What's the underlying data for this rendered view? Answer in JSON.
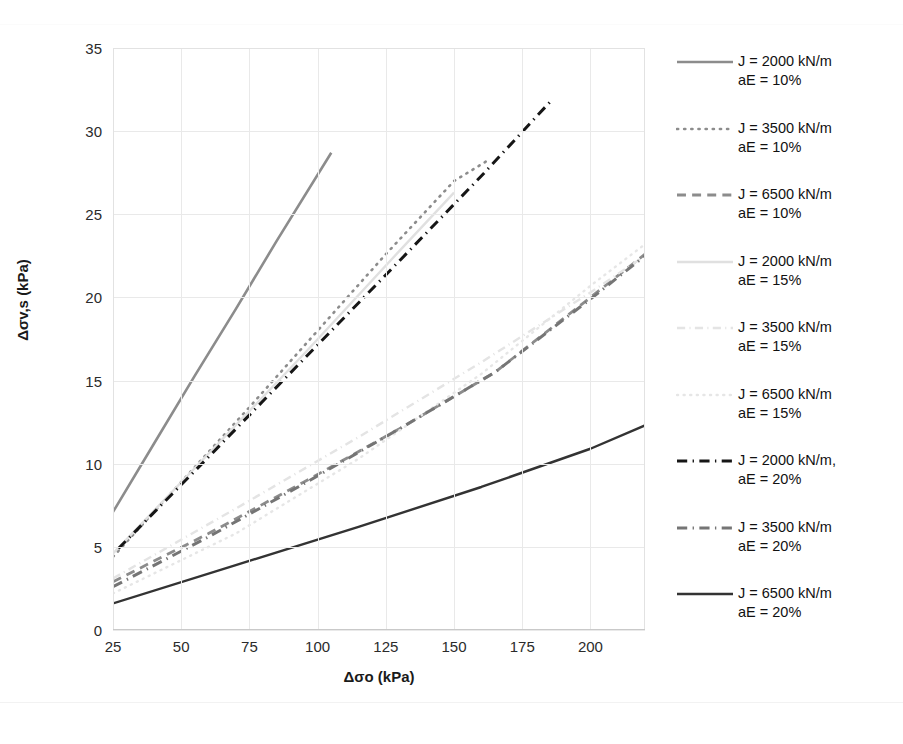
{
  "chart_data": {
    "type": "line",
    "title": "",
    "xlabel": "Δσo (kPa)",
    "ylabel": "Δσv,s (kPa)",
    "xlim": [
      25,
      220
    ],
    "ylim": [
      0,
      35
    ],
    "xticks": [
      25,
      50,
      75,
      100,
      125,
      150,
      175,
      200
    ],
    "yticks": [
      0,
      5,
      10,
      15,
      20,
      25,
      30,
      35
    ],
    "grid": true,
    "legend_position": "right",
    "series": [
      {
        "name": "J = 2000 kN/m\naE = 10%",
        "label_line1": "J = 2000 kN/m",
        "label_line2": "aE = 10%",
        "style": "solid",
        "color": "#8c8c8c",
        "width": 2.6,
        "x": [
          25,
          40,
          55,
          70,
          85,
          105
        ],
        "y": [
          7.1,
          11.2,
          15.3,
          19.3,
          23.4,
          28.7
        ]
      },
      {
        "name": "J = 3500 kN/m\naE = 10%",
        "label_line1": "J = 3500 kN/m",
        "label_line2": "aE = 10%",
        "style": "dotted",
        "color": "#8c8c8c",
        "width": 2.6,
        "x": [
          25,
          50,
          75,
          100,
          125,
          150,
          163
        ],
        "y": [
          4.4,
          8.9,
          13.4,
          18.0,
          22.6,
          27.0,
          28.3
        ]
      },
      {
        "name": "J = 6500 kN/m\naE = 10%",
        "label_line1": "J = 6500 kN/m",
        "label_line2": "aE = 10%",
        "style": "dashed",
        "color": "#8c8c8c",
        "width": 2.8,
        "x": [
          25,
          60,
          95,
          130,
          165,
          200,
          220
        ],
        "y": [
          2.9,
          5.8,
          8.9,
          12.1,
          15.5,
          20.0,
          22.6
        ]
      },
      {
        "name": "J = 2000 kN/m\naE = 15%",
        "label_line1": "J = 2000 kN/m",
        "label_line2": "aE = 15%",
        "style": "solid",
        "color": "#e0e0e0",
        "width": 2.4,
        "x": [
          25,
          60,
          95,
          130,
          150
        ],
        "y": [
          4.6,
          10.6,
          16.6,
          22.8,
          26.3
        ]
      },
      {
        "name": "J = 3500 kN/m\naE = 15%",
        "label_line1": "J = 3500 kN/m",
        "label_line2": "aE = 15%",
        "style": "dashdot",
        "color": "#e4e4e4",
        "width": 2.4,
        "x": [
          25,
          70,
          115,
          160,
          200,
          220
        ],
        "y": [
          3.1,
          7.3,
          11.6,
          16.1,
          20.3,
          22.5
        ]
      },
      {
        "name": "J = 6500 kN/m\naE = 15%",
        "label_line1": "J = 6500 kN/m",
        "label_line2": "aE = 15%",
        "style": "dotted",
        "color": "#e6e6e6",
        "width": 2.4,
        "x": [
          25,
          70,
          115,
          160,
          200,
          220
        ],
        "y": [
          2.2,
          5.8,
          10.3,
          15.4,
          20.7,
          23.2
        ]
      },
      {
        "name": "J = 2000 kN/m, aE = 20%",
        "label_line1": "J = 2000 kN/m,",
        "label_line2": "aE = 20%",
        "style": "dashdot",
        "color": "#161616",
        "width": 3.0,
        "x": [
          27,
          60,
          95,
          130,
          160,
          186
        ],
        "y": [
          4.9,
          10.4,
          16.3,
          22.2,
          27.3,
          31.9
        ]
      },
      {
        "name": "J = 3500 kN/m\naE = 20%",
        "label_line1": "J = 3500 kN/m",
        "label_line2": "aE = 20%",
        "style": "dashdot",
        "color": "#757575",
        "width": 3.0,
        "x": [
          25,
          60,
          95,
          130,
          165,
          200,
          220
        ],
        "y": [
          2.6,
          5.6,
          8.8,
          12.1,
          15.5,
          19.9,
          22.5
        ]
      },
      {
        "name": "J = 6500 kN/m\naE = 20%",
        "label_line1": "J = 6500 kN/m",
        "label_line2": "aE = 20%",
        "style": "solid",
        "color": "#333333",
        "width": 2.4,
        "x": [
          25,
          70,
          115,
          160,
          200,
          220
        ],
        "y": [
          1.6,
          3.9,
          6.2,
          8.6,
          10.9,
          12.3
        ]
      }
    ]
  },
  "axes": {
    "y_title": "Δσv,s (kPa)",
    "x_title": "Δσo (kPa)"
  },
  "legend": {
    "items": [
      {
        "label": "J = 2000 kN/m\naE = 10%"
      },
      {
        "label": "J = 3500 kN/m\naE = 10%"
      },
      {
        "label": "J = 6500 kN/m\naE = 10%"
      },
      {
        "label": "J = 2000 kN/m\naE = 15%"
      },
      {
        "label": "J = 3500 kN/m\naE = 15%"
      },
      {
        "label": "J = 6500 kN/m\naE = 15%"
      },
      {
        "label": "J = 2000 kN/m,\naE = 20%"
      },
      {
        "label": "J = 3500 kN/m\naE = 20%"
      },
      {
        "label": "J = 6500 kN/m\naE = 20%"
      }
    ]
  },
  "caption": {
    "fragment": ""
  }
}
